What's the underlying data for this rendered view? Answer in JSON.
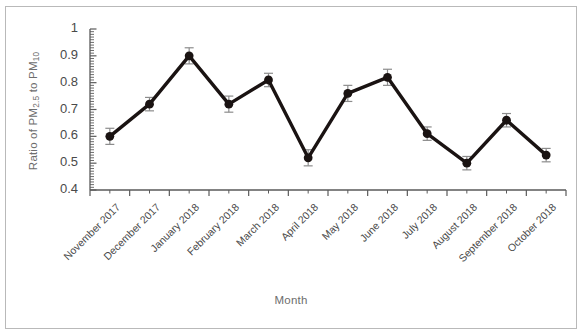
{
  "chart_data": {
    "type": "line",
    "title": "",
    "subtitle": "",
    "xlabel": "Month",
    "ylabel": "Ratio of PM2.5 to PM10",
    "ylabel_parts": {
      "prefix": "Ratio of PM",
      "sub1": "2.5",
      "middle": " to PM",
      "sub2": "10"
    },
    "categories": [
      "November 2017",
      "December 2017",
      "January 2018",
      "February 2018",
      "March 2018",
      "April 2018",
      "May 2018",
      "June 2018",
      "July 2018",
      "August 2018",
      "September 2018",
      "October 2018"
    ],
    "values": [
      0.6,
      0.72,
      0.9,
      0.72,
      0.81,
      0.52,
      0.76,
      0.82,
      0.61,
      0.5,
      0.66,
      0.53
    ],
    "errors": [
      0.03,
      0.025,
      0.03,
      0.03,
      0.025,
      0.03,
      0.03,
      0.03,
      0.025,
      0.025,
      0.025,
      0.025
    ],
    "ylim": [
      0.4,
      1.0
    ],
    "ytick_labels": [
      "0.4",
      "0.5",
      "0.6",
      "0.7",
      "0.8",
      "0.9",
      "1"
    ],
    "ytick_values": [
      0.4,
      0.5,
      0.6,
      0.7,
      0.8,
      0.9,
      1.0
    ],
    "minor_tick_step": 0.01,
    "grid": false,
    "legend": false,
    "legend_position": "none",
    "series": [
      {
        "name": "Ratio of PM2.5 to PM10",
        "values": [
          0.6,
          0.72,
          0.9,
          0.72,
          0.81,
          0.52,
          0.76,
          0.82,
          0.61,
          0.5,
          0.66,
          0.53
        ]
      }
    ],
    "colors": {
      "line": "#1a1312",
      "marker": "#1a1312",
      "errorbar": "#8c8c8c",
      "axis": "#5a5a5a",
      "tick_text": "#4a4a4a",
      "axis_title": "#6d6d6d",
      "frame": "#b9b9b9",
      "background": "#ffffff"
    }
  }
}
